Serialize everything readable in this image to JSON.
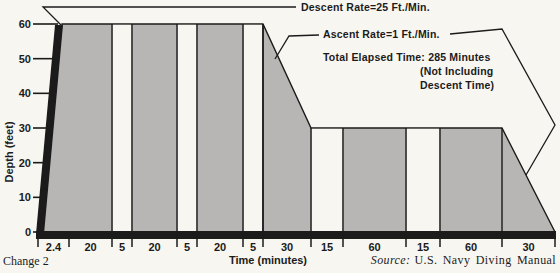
{
  "page": {
    "change_note": "Change 2",
    "source_prefix": "Source:",
    "source_text": "U.S. Navy Diving Manual"
  },
  "annotations": {
    "descent_rate": "Descent Rate=25 Ft./Min.",
    "ascent_rate": "Ascent Rate=1 Ft./Min.",
    "total_elapsed": "Total Elapsed Time: 285 Minutes",
    "total_elapsed_note1": "(Not Including",
    "total_elapsed_note2": "Descent Time)"
  },
  "chart_data": {
    "type": "area",
    "title": "",
    "xlabel": "Time (minutes)",
    "ylabel": "Depth (feet)",
    "ylim": [
      0,
      60
    ],
    "y_ticks": [
      60,
      50,
      40,
      30,
      20,
      10,
      0
    ],
    "grid": false,
    "descent_rate_ft_per_min": 25,
    "ascent_rate_ft_per_min": 1,
    "total_elapsed_minutes": 285,
    "x_segment_labels": [
      "2.4",
      "20",
      "5",
      "20",
      "5",
      "20",
      "5",
      "30",
      "15",
      "60",
      "15",
      "60",
      "30"
    ],
    "segments": [
      {
        "label": "2.4",
        "minutes": 2.4,
        "kind": "descent",
        "from_depth": 0,
        "to_depth": 60,
        "fill": "gray",
        "px": 31
      },
      {
        "label": "20",
        "minutes": 20,
        "kind": "bottom",
        "from_depth": 60,
        "to_depth": 60,
        "fill": "gray",
        "px": 43
      },
      {
        "label": "5",
        "minutes": 5,
        "kind": "stop-gap",
        "from_depth": 60,
        "to_depth": 60,
        "fill": "white",
        "px": 20
      },
      {
        "label": "20",
        "minutes": 20,
        "kind": "bottom",
        "from_depth": 60,
        "to_depth": 60,
        "fill": "gray",
        "px": 45
      },
      {
        "label": "5",
        "minutes": 5,
        "kind": "stop-gap",
        "from_depth": 60,
        "to_depth": 60,
        "fill": "white",
        "px": 20
      },
      {
        "label": "20",
        "minutes": 20,
        "kind": "bottom",
        "from_depth": 60,
        "to_depth": 60,
        "fill": "gray",
        "px": 46
      },
      {
        "label": "5",
        "minutes": 5,
        "kind": "stop-gap",
        "from_depth": 60,
        "to_depth": 60,
        "fill": "white",
        "px": 20
      },
      {
        "label": "30",
        "minutes": 30,
        "kind": "ascent",
        "from_depth": 60,
        "to_depth": 30,
        "fill": "gray",
        "px": 48
      },
      {
        "label": "15",
        "minutes": 15,
        "kind": "stop-gap",
        "from_depth": 30,
        "to_depth": 30,
        "fill": "white",
        "px": 32
      },
      {
        "label": "60",
        "minutes": 60,
        "kind": "bottom",
        "from_depth": 30,
        "to_depth": 30,
        "fill": "gray",
        "px": 63
      },
      {
        "label": "15",
        "minutes": 15,
        "kind": "stop-gap",
        "from_depth": 30,
        "to_depth": 30,
        "fill": "white",
        "px": 34
      },
      {
        "label": "60",
        "minutes": 60,
        "kind": "bottom",
        "from_depth": 30,
        "to_depth": 30,
        "fill": "gray",
        "px": 62
      },
      {
        "label": "30",
        "minutes": 30,
        "kind": "ascent",
        "from_depth": 30,
        "to_depth": 0,
        "fill": "gray",
        "px": 53
      }
    ],
    "colors": {
      "area_fill": "#b7b6b4",
      "line": "#1b1b1b",
      "background": "#f8f6f1"
    },
    "layout": {
      "x0": 38,
      "y_surface": 232,
      "y_top": 24,
      "descent_apex_px": 24,
      "axis_bar": {
        "x1": 36,
        "x2": 556,
        "y": 231,
        "h": 8
      },
      "x_tick_y1": 239,
      "x_tick_y2": 247,
      "x_label_y": 251,
      "y_label_x": 31,
      "y_tick_x1": 33
    }
  }
}
